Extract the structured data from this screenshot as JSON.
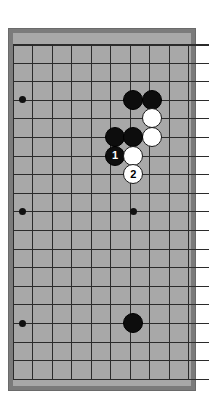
{
  "diagram": {
    "type": "go-board-diagram",
    "background_color": "#ffffff",
    "board": {
      "frame_color": "#7b7b7b",
      "surface_color": "#a8a8a8",
      "line_color": "#2b2b2b",
      "frame": {
        "x": 8,
        "y": 28,
        "width": 188,
        "height": 363
      },
      "surface": {
        "x": 13,
        "y": 33,
        "width": 178,
        "height": 353
      },
      "grid": {
        "origin_x": 13,
        "origin_y": 44,
        "cell_w": 19.45,
        "cell_h": 18.6,
        "cols": 10,
        "rows": 19,
        "cropped_left": true,
        "cropped_bottom": false
      }
    },
    "star_points": [
      {
        "name": "star-upper-left",
        "col": 0.5,
        "row": 3
      },
      {
        "name": "star-middle-left",
        "col": 0.5,
        "row": 9
      },
      {
        "name": "star-lower-left",
        "col": 0.5,
        "row": 15
      },
      {
        "name": "star-center",
        "col": 6.18,
        "row": 9
      }
    ],
    "stones": [
      {
        "id": "b-c6r3",
        "color": "black",
        "col": 6.18,
        "row": 3,
        "label": ""
      },
      {
        "id": "b-c7r3",
        "color": "black",
        "col": 7.15,
        "row": 3,
        "label": ""
      },
      {
        "id": "w-c7r4",
        "color": "white",
        "col": 7.15,
        "row": 4,
        "label": ""
      },
      {
        "id": "w-c7r5",
        "color": "white",
        "col": 7.15,
        "row": 5,
        "label": ""
      },
      {
        "id": "b-c5r5",
        "color": "black",
        "col": 5.25,
        "row": 5,
        "label": ""
      },
      {
        "id": "b-c6r5",
        "color": "black",
        "col": 6.18,
        "row": 5,
        "label": ""
      },
      {
        "id": "b-move-1",
        "color": "black",
        "col": 5.25,
        "row": 6,
        "label": "1"
      },
      {
        "id": "w-c6r6",
        "color": "white",
        "col": 6.18,
        "row": 6,
        "label": ""
      },
      {
        "id": "w-move-2",
        "color": "white",
        "col": 6.18,
        "row": 7,
        "label": "2"
      },
      {
        "id": "b-c6r15",
        "color": "black",
        "col": 6.18,
        "row": 15,
        "label": ""
      }
    ],
    "move_labels": {
      "move_1": "1",
      "move_2": "2"
    },
    "stone_diameter": 20
  }
}
